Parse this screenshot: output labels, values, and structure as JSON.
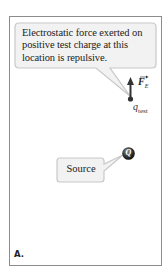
{
  "diagram": {
    "panel_label": "A.",
    "callout_force": {
      "text": "Electrostatic force exerted on positive test charge at this location is repulsive."
    },
    "callout_source": {
      "text": "Source"
    },
    "force_vector": {
      "symbol": "F",
      "subscript": "E",
      "direction": "up"
    },
    "test_charge": {
      "symbol": "q",
      "subscript": "test"
    },
    "source_charge": {
      "symbol": "Q"
    },
    "colors": {
      "frame_border": "#8c8c8c",
      "callout_fill": "#f2f2f2",
      "callout_border": "#c8c8c8",
      "arrow": "#333333",
      "source_ball": "#3a3a3a"
    }
  }
}
